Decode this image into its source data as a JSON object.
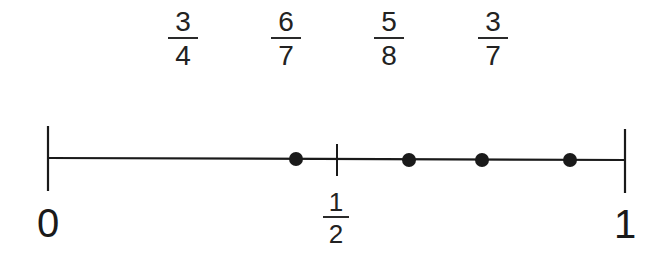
{
  "fractions_to_place": [
    {
      "numerator": "3",
      "denominator": "4",
      "cx": 183
    },
    {
      "numerator": "6",
      "denominator": "7",
      "cx": 286
    },
    {
      "numerator": "5",
      "denominator": "8",
      "cx": 389
    },
    {
      "numerator": "3",
      "denominator": "7",
      "cx": 493
    }
  ],
  "number_line": {
    "start_label": "0",
    "end_label": "1",
    "midpoint_label": {
      "numerator": "1",
      "denominator": "2"
    },
    "start_x": 48,
    "end_x": 625,
    "midpoint_x": 337,
    "y": 159,
    "points": [
      {
        "x": 296,
        "approx_value": 0.43
      },
      {
        "x": 409,
        "approx_value": 0.625
      },
      {
        "x": 482,
        "approx_value": 0.75
      },
      {
        "x": 570,
        "approx_value": 0.86
      }
    ]
  },
  "colors": {
    "line": "#1a1a1a",
    "dot": "#1a1a1a",
    "background": "#ffffff"
  }
}
